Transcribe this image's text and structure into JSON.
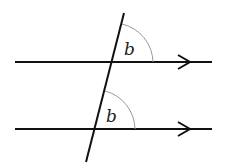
{
  "diagram": {
    "angle_labels": [
      "b",
      "b"
    ],
    "colors": {
      "line": "#111111",
      "arc": "#999999"
    }
  }
}
